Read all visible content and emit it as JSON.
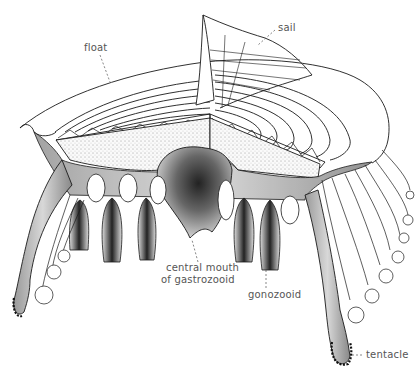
{
  "figure": {
    "labels": {
      "float": "float",
      "sail": "sail",
      "mouth_line1": "central mouth",
      "mouth_line2": "of gastrozooid",
      "gonozooid": "gonozooid",
      "tentacle": "tentacle"
    }
  },
  "colors": {
    "ink": "#1a1a1a",
    "label": "#555555",
    "shade": "#777777",
    "background": "#ffffff"
  }
}
